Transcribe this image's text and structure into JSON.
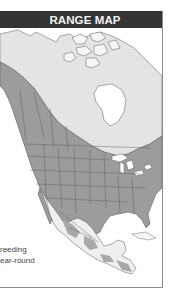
{
  "header": {
    "title": "RANGE MAP"
  },
  "legend": {
    "items": [
      {
        "label": "reeding",
        "full_label": "Breeding",
        "color": "#e6e6e6"
      },
      {
        "label": "ear-round",
        "full_label": "Year-round",
        "color": "#9a9a9a"
      }
    ]
  },
  "map": {
    "region": "North America",
    "colors": {
      "background": "#ffffff",
      "land": "#f4f4f4",
      "breeding": "#e3e3e3",
      "year_round": "#9c9c9c",
      "borders": "#666666",
      "water": "#ffffff",
      "header": "#343434",
      "frame_border": "#8a8a8a"
    }
  }
}
